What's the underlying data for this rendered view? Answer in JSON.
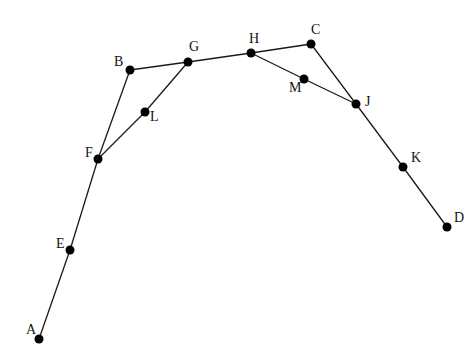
{
  "diagram": {
    "type": "graph",
    "nodes": [
      {
        "id": "A",
        "label": "A",
        "x": 39,
        "y": 339,
        "lx": 26,
        "ly": 334
      },
      {
        "id": "E",
        "label": "E",
        "x": 70,
        "y": 250,
        "lx": 56,
        "ly": 248
      },
      {
        "id": "F",
        "label": "F",
        "x": 98,
        "y": 159,
        "lx": 85,
        "ly": 157
      },
      {
        "id": "B",
        "label": "B",
        "x": 130,
        "y": 70,
        "lx": 114,
        "ly": 66
      },
      {
        "id": "L",
        "label": "L",
        "x": 145,
        "y": 112,
        "lx": 150,
        "ly": 121
      },
      {
        "id": "G",
        "label": "G",
        "x": 188,
        "y": 62,
        "lx": 189,
        "ly": 51
      },
      {
        "id": "H",
        "label": "H",
        "x": 251,
        "y": 53,
        "lx": 249,
        "ly": 43
      },
      {
        "id": "C",
        "label": "C",
        "x": 311,
        "y": 44,
        "lx": 311,
        "ly": 34
      },
      {
        "id": "M",
        "label": "M",
        "x": 304,
        "y": 79,
        "lx": 289,
        "ly": 92
      },
      {
        "id": "J",
        "label": "J",
        "x": 356,
        "y": 104,
        "lx": 365,
        "ly": 106
      },
      {
        "id": "K",
        "label": "K",
        "x": 403,
        "y": 167,
        "lx": 411,
        "ly": 162
      },
      {
        "id": "D",
        "label": "D",
        "x": 447,
        "y": 227,
        "lx": 454,
        "ly": 222
      }
    ],
    "edges": [
      [
        "A",
        "E"
      ],
      [
        "E",
        "F"
      ],
      [
        "F",
        "B"
      ],
      [
        "B",
        "G"
      ],
      [
        "G",
        "H"
      ],
      [
        "H",
        "C"
      ],
      [
        "C",
        "J"
      ],
      [
        "J",
        "K"
      ],
      [
        "K",
        "D"
      ],
      [
        "F",
        "L"
      ],
      [
        "L",
        "G"
      ],
      [
        "H",
        "M"
      ],
      [
        "M",
        "J"
      ]
    ],
    "node_radius": 4.5,
    "colors": {
      "edge": "#1a1a1a",
      "node": "#000000",
      "label": "#111111",
      "background": "#ffffff"
    }
  }
}
